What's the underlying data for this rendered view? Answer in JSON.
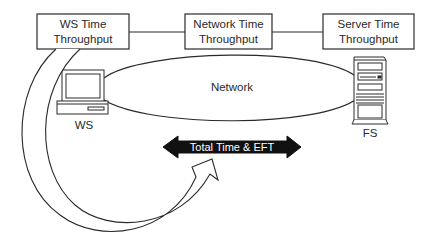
{
  "diagram": {
    "boxes": [
      {
        "id": "ws",
        "line1": "WS Time",
        "line2": "Throughput"
      },
      {
        "id": "network",
        "line1": "Network Time",
        "line2": "Throughput"
      },
      {
        "id": "server",
        "line1": "Server Time",
        "line2": "Throughput"
      }
    ],
    "network_label": "Network",
    "workstation_label": "WS",
    "server_label": "FS",
    "total_arrow_label": "Total Time & EFT",
    "icons": [
      "workstation-computer-icon",
      "file-server-tower-icon"
    ],
    "colors": {
      "stroke": "#2a2a2a",
      "background": "#ffffff",
      "arrow_fill": "#111111",
      "arrow_text": "#ffffff"
    }
  }
}
